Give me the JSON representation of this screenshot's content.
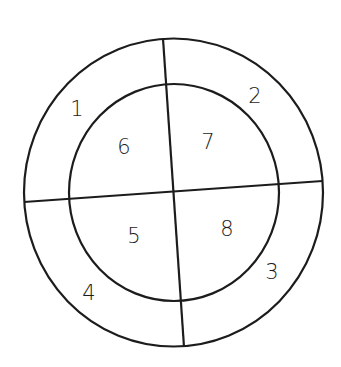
{
  "diagram": {
    "type": "segmented-concentric-circles",
    "stroke_color": "#1c1c1c",
    "background": "#ffffff",
    "outer_ring_regions": [
      {
        "id": "region-1",
        "label": "1",
        "position": "outer-upper-left"
      },
      {
        "id": "region-2",
        "label": "2",
        "position": "outer-upper-right"
      },
      {
        "id": "region-3",
        "label": "3",
        "position": "outer-lower-right"
      },
      {
        "id": "region-4",
        "label": "4",
        "position": "outer-lower-left"
      }
    ],
    "inner_circle_regions": [
      {
        "id": "region-5",
        "label": "5",
        "position": "inner-lower-left"
      },
      {
        "id": "region-6",
        "label": "6",
        "position": "inner-upper-left"
      },
      {
        "id": "region-7",
        "label": "7",
        "position": "inner-upper-right"
      },
      {
        "id": "region-8",
        "label": "8",
        "position": "inner-lower-right"
      }
    ],
    "labels": {
      "l1": "1",
      "l2": "2",
      "l3": "3",
      "l4": "4",
      "l5": "5",
      "l6": "6",
      "l7": "7",
      "l8": "8"
    }
  }
}
